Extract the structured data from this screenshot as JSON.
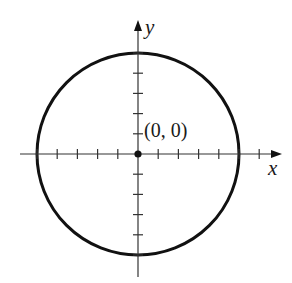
{
  "figure": {
    "center_label": "(0, 0)",
    "x_axis_label": "x",
    "y_axis_label": "y",
    "center": [
      0,
      0
    ],
    "radius": 5,
    "x_ticks": [
      -5,
      -4,
      -3,
      -2,
      -1,
      1,
      2,
      3,
      4,
      5,
      6
    ],
    "y_ticks": [
      -5,
      -4,
      -3,
      -2,
      -1,
      1,
      2,
      3,
      4,
      5
    ],
    "colors": {
      "stroke": "#111111",
      "background": "#ffffff"
    }
  }
}
